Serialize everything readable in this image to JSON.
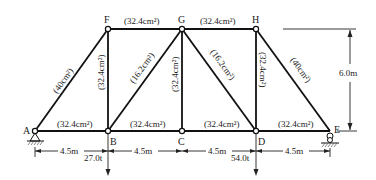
{
  "diagram": {
    "type": "truss",
    "nodes": [
      {
        "id": "A",
        "x": 35,
        "y": 131
      },
      {
        "id": "B",
        "x": 108,
        "y": 131
      },
      {
        "id": "C",
        "x": 182,
        "y": 131
      },
      {
        "id": "D",
        "x": 256,
        "y": 131
      },
      {
        "id": "E",
        "x": 330,
        "y": 131
      },
      {
        "id": "F",
        "x": 108,
        "y": 29
      },
      {
        "id": "G",
        "x": 182,
        "y": 29
      },
      {
        "id": "H",
        "x": 256,
        "y": 29
      }
    ],
    "members": [
      {
        "from": "A",
        "to": "B",
        "area": "(32.4cm²)"
      },
      {
        "from": "B",
        "to": "C",
        "area": "(32.4cm²)"
      },
      {
        "from": "C",
        "to": "D",
        "area": "(32.4cm²)"
      },
      {
        "from": "D",
        "to": "E",
        "area": "(32.4cm²)"
      },
      {
        "from": "F",
        "to": "G",
        "area": "(32.4cm²)"
      },
      {
        "from": "G",
        "to": "H",
        "area": "(32.4cm²)"
      },
      {
        "from": "A",
        "to": "F",
        "area": "(40cm²)"
      },
      {
        "from": "H",
        "to": "E",
        "area": "(40cm²)"
      },
      {
        "from": "B",
        "to": "F",
        "area": "(32.4cm²)"
      },
      {
        "from": "C",
        "to": "G",
        "area": "(32.4cm²)"
      },
      {
        "from": "D",
        "to": "H",
        "area": "(32.4cm²)"
      },
      {
        "from": "B",
        "to": "G",
        "area": "(16.2cm²)"
      },
      {
        "from": "G",
        "to": "D",
        "area": "(16.2cm²)"
      }
    ],
    "labels": {
      "A": "A",
      "B": "B",
      "C": "C",
      "D": "D",
      "E": "E",
      "F": "F",
      "G": "G",
      "H": "H",
      "ab": "(32.4cm²)",
      "bc": "(32.4cm²)",
      "cd": "(32.4cm²)",
      "de": "(32.4cm²)",
      "fg": "(32.4cm²)",
      "gh": "(32.4cm²)",
      "af": "(40cm²)",
      "he": "(40cm²)",
      "bf": "(32.4cm²)",
      "cg": "(32.4cm²)",
      "dh": "(32.4cm²)",
      "bg": "(16.2cm²)",
      "gd": "(16.2cm²)"
    },
    "spans": [
      "4.5m",
      "4.5m",
      "4.5m",
      "4.5m"
    ],
    "height": "6.0m",
    "loads": [
      {
        "node": "B",
        "value": "27.0t"
      },
      {
        "node": "D",
        "value": "54.0t"
      }
    ],
    "supports": [
      {
        "node": "A",
        "type": "pin"
      },
      {
        "node": "E",
        "type": "roller"
      }
    ]
  }
}
